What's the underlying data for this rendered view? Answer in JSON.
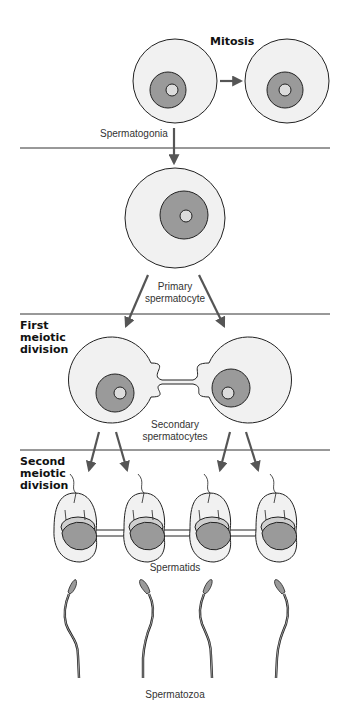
{
  "diagram": {
    "colors": {
      "cell_fill": "#f1f1f1",
      "nucleus_fill": "#9a9a9a",
      "nucleolus_fill": "#dcdcdc",
      "outline": "#222222",
      "arrow": "#555555",
      "divider": "#333333"
    },
    "stages": [
      {
        "id": "mitosis",
        "label": "Mitosis"
      },
      {
        "id": "first-meiotic",
        "label_lines": [
          "First",
          "meiotic",
          "division"
        ]
      },
      {
        "id": "second-meiotic",
        "label_lines": [
          "Second",
          "meiotic",
          "division"
        ]
      }
    ],
    "cell_labels": {
      "spermatogonia": "Spermatogonia",
      "primary_lines": [
        "Primary",
        "spermatocyte"
      ],
      "secondary_lines": [
        "Secondary",
        "spermatocytes"
      ],
      "spermatids": "Spermatids",
      "spermatozoa": "Spermatozoa"
    },
    "counts": {
      "spermatogonia": 2,
      "primary_spermatocyte": 1,
      "secondary_spermatocytes": 2,
      "spermatids": 4,
      "spermatozoa": 4
    }
  }
}
